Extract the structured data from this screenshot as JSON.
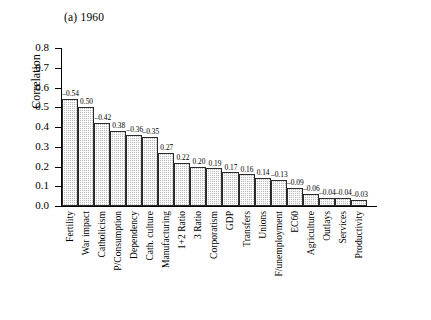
{
  "figure": {
    "title": "(a) 1960",
    "ylabel": "Correlation"
  },
  "chart_data": {
    "type": "bar",
    "title": "(a) 1960",
    "xlabel": "",
    "ylabel": "Correlation",
    "ylim": [
      0,
      0.8
    ],
    "yticks": [
      "0.0",
      "0.1",
      "0.2",
      "0.3",
      "0.4",
      "0.5",
      "0.6",
      "0.7",
      "0.8"
    ],
    "ytick_values": [
      0,
      0.1,
      0.2,
      0.3,
      0.4,
      0.5,
      0.6,
      0.7,
      0.8
    ],
    "grid": false,
    "legend": "none",
    "note": "Bar heights show absolute correlation magnitude; printed labels carry the sign.",
    "categories": [
      "Fertility",
      "War impact",
      "Catholicism",
      "P/Consumption",
      "Dependency",
      "Cath. culture",
      "Manufacturing",
      "1+2 Ratio",
      "3 Ratio",
      "Corporatism",
      "GDP",
      "Transfers",
      "Unions",
      "F/unemployment",
      "EC60",
      "Agriculture",
      "Outlays",
      "Services",
      "Productivity"
    ],
    "values": [
      0.54,
      0.5,
      0.42,
      0.38,
      0.36,
      0.35,
      0.27,
      0.22,
      0.2,
      0.19,
      0.17,
      0.16,
      0.14,
      0.13,
      0.09,
      0.06,
      0.04,
      0.04,
      0.03
    ],
    "signed_values": [
      -0.54,
      0.5,
      -0.42,
      0.38,
      -0.36,
      -0.35,
      0.27,
      0.22,
      0.2,
      0.19,
      0.17,
      0.16,
      0.14,
      -0.13,
      -0.09,
      -0.06,
      -0.04,
      -0.04,
      -0.03
    ],
    "data_labels": [
      "–0.54",
      "0.50",
      "–0.42",
      "0.38",
      "–0.36",
      "–0.35",
      "0.27",
      "0.22",
      "0.20",
      "0.19",
      "0.17",
      "0.16",
      "0.14",
      "–0.13",
      "–0.09",
      "–0.06",
      "–0.04",
      "–0.04",
      "–0.03"
    ]
  }
}
